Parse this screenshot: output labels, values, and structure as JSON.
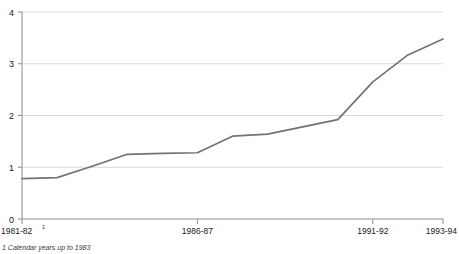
{
  "chart_data": {
    "type": "line",
    "title": "",
    "subtitle": "",
    "xlabel": "",
    "ylabel": "",
    "grid": true,
    "legend": "none",
    "x": [
      "1981-82",
      "1982-83",
      "1983-84",
      "1984-85",
      "1985-86",
      "1986-87",
      "1987-88",
      "1988-89",
      "1989-90",
      "1990-91",
      "1991-92",
      "1992-93",
      "1993-94"
    ],
    "values": [
      0.78,
      0.8,
      1.02,
      1.25,
      1.27,
      1.28,
      1.6,
      1.64,
      1.78,
      1.92,
      2.65,
      3.17,
      3.48
    ],
    "series": [
      {
        "name": "series-1",
        "values": [
          0.78,
          0.8,
          1.02,
          1.25,
          1.27,
          1.28,
          1.6,
          1.64,
          1.78,
          1.92,
          2.65,
          3.17,
          3.48
        ],
        "color": "#737373"
      }
    ],
    "xlim": [
      0,
      12
    ],
    "ylim": [
      0,
      4
    ],
    "ytick_labels": [
      "0",
      "1",
      "2",
      "3",
      "4"
    ],
    "ytick_values": [
      0,
      1,
      2,
      3,
      4
    ],
    "xtick_labels": [
      "1981-82",
      "1986-87",
      "1991-92",
      "1993-94"
    ],
    "xtick_values": [
      0,
      5,
      10,
      12
    ],
    "annotations": [
      "1"
    ]
  },
  "axes": {
    "y": {
      "ticks": [
        {
          "label": "4",
          "value": 4
        },
        {
          "label": "3",
          "value": 3
        },
        {
          "label": "2",
          "value": 2
        },
        {
          "label": "1",
          "value": 1
        },
        {
          "label": "0",
          "value": 0
        }
      ]
    },
    "x": {
      "ticks": [
        {
          "label": "1981-82",
          "superscript": "1",
          "value": 0
        },
        {
          "label": "1986-87",
          "superscript": "",
          "value": 5
        },
        {
          "label": "1991-92",
          "superscript": "",
          "value": 10
        },
        {
          "label": "1993-94",
          "superscript": "",
          "value": 12
        }
      ]
    }
  },
  "footnote": {
    "marker": "1",
    "text": "1 Calendar years up to 1983"
  },
  "colors": {
    "line": "#737373",
    "grid": "#d9d9d9",
    "axis": "#8c8c8c",
    "text": "#1a1a1a"
  }
}
